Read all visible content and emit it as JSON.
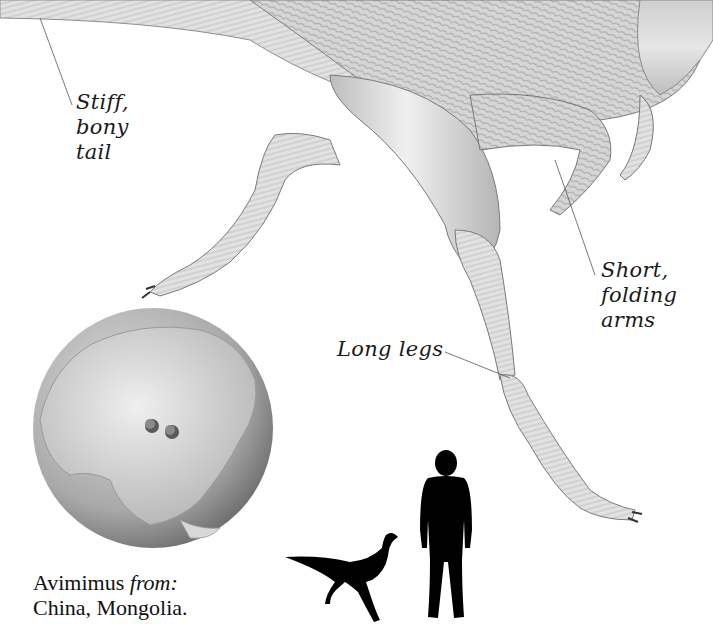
{
  "illustration": {
    "subject": "Avimimus",
    "labels": {
      "tail": [
        "Stiff,",
        "bony",
        "tail"
      ],
      "arms": [
        "Short,",
        "folding",
        "arms"
      ],
      "legs": "Long legs"
    }
  },
  "globe": {
    "region": "Asia",
    "markers": 2
  },
  "caption": {
    "name": "Avimimus",
    "from_label": "from:",
    "locations": "China, Mongolia."
  },
  "scale_comparison": {
    "items": [
      "dinosaur-silhouette",
      "human-silhouette"
    ]
  },
  "colors": {
    "background": "#ffffff",
    "text": "#1a1a1a",
    "silhouette": "#000000",
    "drawing_light": "#e4e4e4",
    "drawing_mid": "#b8b8b8",
    "drawing_dark": "#6f6f6f"
  }
}
